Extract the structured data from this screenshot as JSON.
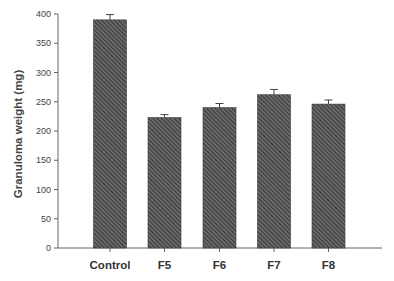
{
  "chart_data": {
    "type": "bar",
    "title": "",
    "xlabel": "",
    "ylabel": "Granuloma weight (mg)",
    "categories": [
      "Control",
      "F5",
      "F6",
      "F7",
      "F8"
    ],
    "values": [
      390,
      223,
      240,
      262,
      246
    ],
    "error_bars": [
      9,
      5,
      7,
      9,
      7
    ],
    "ylim": [
      0,
      400
    ],
    "yticks": [
      0,
      50,
      100,
      150,
      200,
      250,
      300,
      350,
      400
    ],
    "grid": false,
    "legend": null,
    "bar_style": "diagonal hatch, dark gray",
    "colors": {
      "bar_fill": "#5a5a5a",
      "bar_hatch": "#2e2e2e",
      "axis": "#666666",
      "text": "#333333"
    }
  }
}
